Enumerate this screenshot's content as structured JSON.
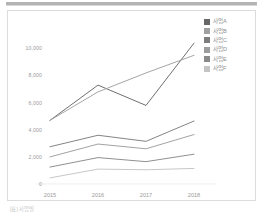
{
  "page": {
    "background": "#ffffff",
    "top_rule_color": "#b4b4b4"
  },
  "bottom_caption": "[표] 사업별",
  "chart_data": {
    "type": "line",
    "title": "",
    "xlabel": "",
    "ylabel": "",
    "categories": [
      "2015",
      "2016",
      "2017",
      "2018"
    ],
    "x_tick_labels": [
      "2015",
      "2016",
      "2017",
      "2018"
    ],
    "y_tick_labels": [
      "0",
      "2,000",
      "4,000",
      "6,000",
      "8,000",
      "10,000"
    ],
    "y_ticks": [
      0,
      2000,
      4000,
      6000,
      8000,
      10000
    ],
    "ylim": [
      0,
      11000
    ],
    "grid": false,
    "legend_position": "right-top",
    "series": [
      {
        "name": "사업A",
        "color": "#676767",
        "values": [
          4700,
          7300,
          5800,
          10400
        ]
      },
      {
        "name": "사업B",
        "color": "#a0a0a0",
        "values": [
          4700,
          6800,
          8200,
          9500
        ]
      },
      {
        "name": "사업C",
        "color": "#7d7d7d",
        "values": [
          2750,
          3600,
          3150,
          4650
        ]
      },
      {
        "name": "사업D",
        "color": "#9d9d9d",
        "values": [
          2000,
          2950,
          2600,
          3650
        ]
      },
      {
        "name": "사업E",
        "color": "#8a8a8a",
        "values": [
          1250,
          1950,
          1650,
          2200
        ]
      },
      {
        "name": "사업F",
        "color": "#c4c4c4",
        "values": [
          450,
          1100,
          1050,
          1150
        ]
      }
    ]
  },
  "legend": {
    "items": [
      {
        "label": "사업A",
        "color": "#676767"
      },
      {
        "label": "사업B",
        "color": "#a0a0a0"
      },
      {
        "label": "사업C",
        "color": "#7d7d7d"
      },
      {
        "label": "사업D",
        "color": "#9d9d9d"
      },
      {
        "label": "사업E",
        "color": "#8a8a8a"
      },
      {
        "label": "사업F",
        "color": "#c4c4c4"
      }
    ]
  }
}
